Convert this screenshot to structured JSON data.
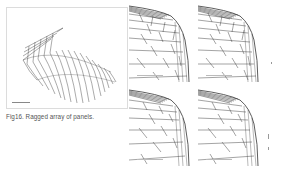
{
  "figure": {
    "caption": "Fig16. Ragged array of panels.",
    "main_panel": {
      "label": ""
    },
    "sub_panels": [
      {
        "id": "top-left",
        "label": ""
      },
      {
        "id": "top-right",
        "label": ""
      },
      {
        "id": "bottom-left",
        "label": ""
      },
      {
        "id": "bottom-right",
        "label": ""
      }
    ]
  },
  "colors": {
    "line": "#333333",
    "frame": "#dcdcdc",
    "caption_text": "#555555"
  }
}
